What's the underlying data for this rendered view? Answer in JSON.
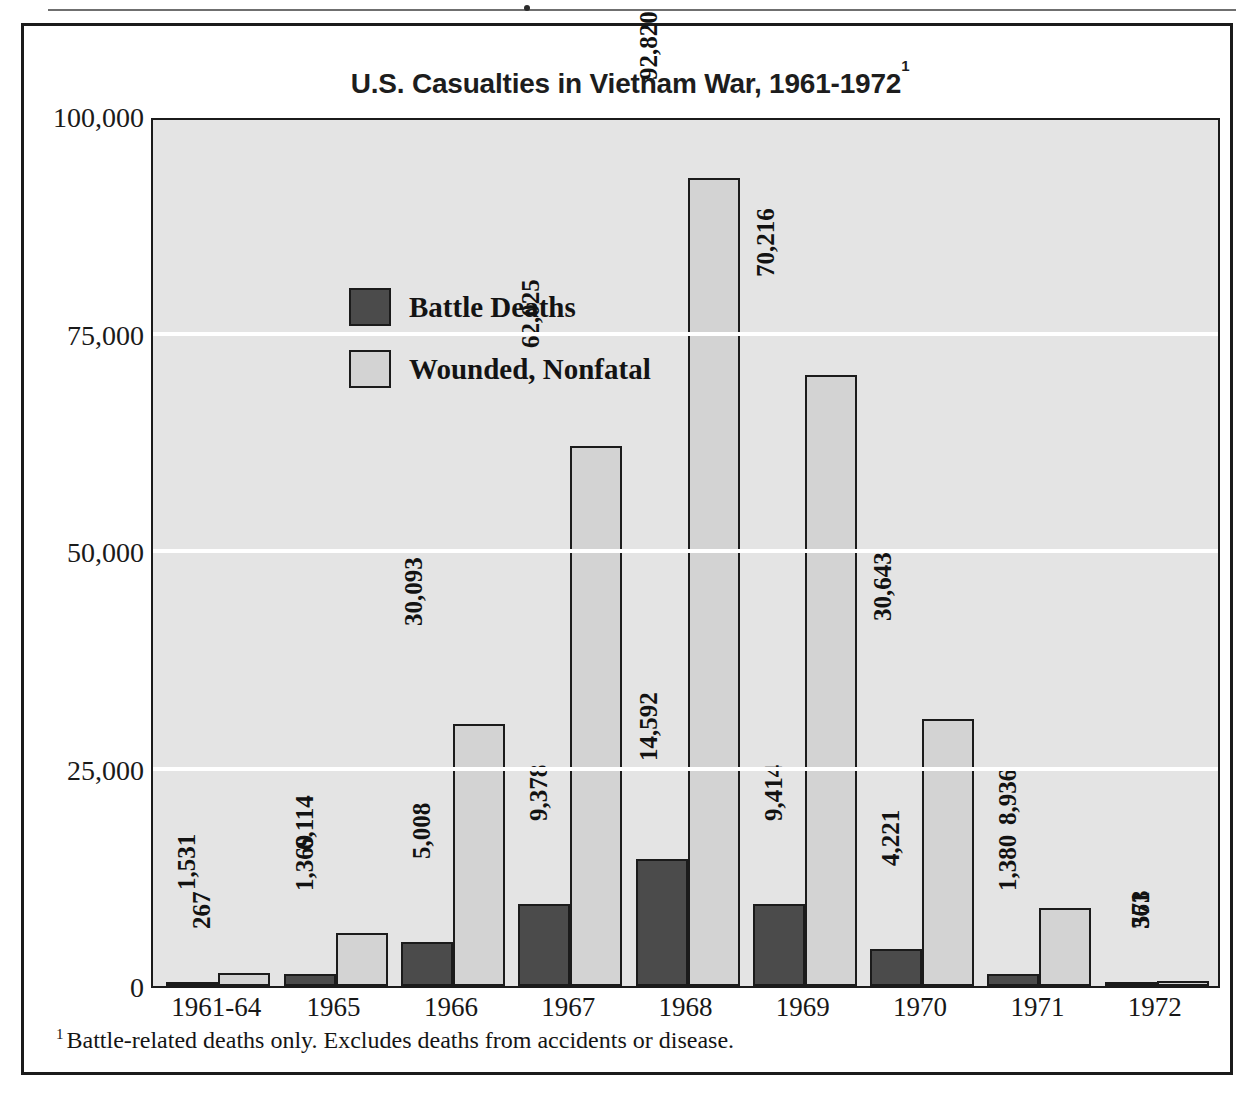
{
  "figure": {
    "title_main": "U.S. Casualties in Vietnam War, 1961-1972",
    "title_superscript": "1",
    "footnote_marker": "1",
    "footnote_text": "Battle-related deaths only. Excludes deaths from accidents or disease."
  },
  "colors": {
    "battle_deaths": "#4b4b4b",
    "wounded_nonfatal": "#d3d3d3",
    "plot_background": "#e4e4e4",
    "gridline": "#ffffff",
    "frame": "#1b1b1b"
  },
  "chart_data": {
    "type": "bar",
    "title": "U.S. Casualties in Vietnam War, 1961-1972",
    "xlabel": "",
    "ylabel": "",
    "ylim": [
      0,
      100000
    ],
    "yticks": [
      0,
      25000,
      50000,
      75000,
      100000
    ],
    "ytick_labels": [
      "0",
      "25,000",
      "50,000",
      "75,000",
      "100,000"
    ],
    "grid": true,
    "legend_position": "inside-top-left",
    "categories": [
      "1961-64",
      "1965",
      "1966",
      "1967",
      "1968",
      "1969",
      "1970",
      "1971",
      "1972"
    ],
    "series": [
      {
        "name": "Battle Deaths",
        "color": "#4b4b4b",
        "values": [
          267,
          1369,
          5008,
          9378,
          14592,
          9414,
          4221,
          1380,
          361
        ],
        "value_labels": [
          "267",
          "1,369",
          "5,008",
          "9,378",
          "14,592",
          "9,414",
          "4,221",
          "1,380",
          "361"
        ]
      },
      {
        "name": "Wounded, Nonfatal",
        "color": "#d3d3d3",
        "values": [
          1531,
          6114,
          30093,
          62025,
          92820,
          70216,
          30643,
          8936,
          573
        ],
        "value_labels": [
          "1,531",
          "6,114",
          "30,093",
          "62,025",
          "92,820",
          "70,216",
          "30,643",
          "8,936",
          "573"
        ]
      }
    ]
  }
}
